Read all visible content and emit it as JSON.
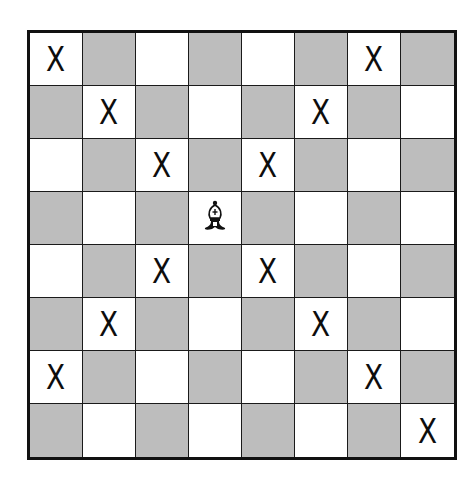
{
  "diagram": {
    "type": "chessboard",
    "size": 8,
    "colors": {
      "light": "#ffffff",
      "dark": "#bdbdbd",
      "line": "#111111"
    },
    "piece": {
      "name": "bishop",
      "color": "white",
      "row": 3,
      "col": 3
    },
    "mark_label": "X",
    "marks": [
      [
        0,
        0
      ],
      [
        0,
        6
      ],
      [
        1,
        1
      ],
      [
        1,
        5
      ],
      [
        2,
        2
      ],
      [
        2,
        4
      ],
      [
        4,
        2
      ],
      [
        4,
        4
      ],
      [
        5,
        1
      ],
      [
        5,
        5
      ],
      [
        6,
        0
      ],
      [
        6,
        6
      ],
      [
        7,
        7
      ]
    ]
  }
}
